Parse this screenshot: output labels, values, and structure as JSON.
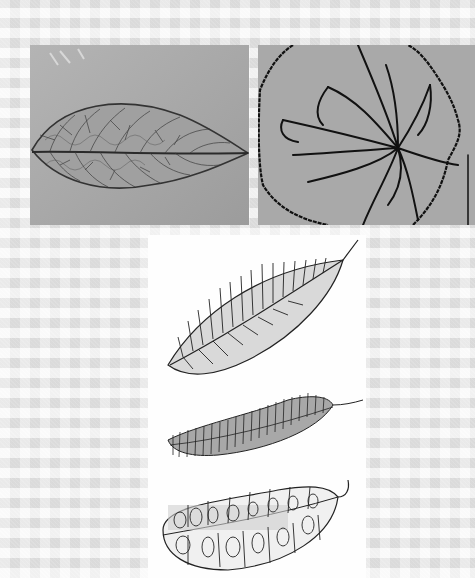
{
  "composition": {
    "background": {
      "pattern": "gingham",
      "base_color": "#e9e9e9"
    },
    "photos": [
      {
        "id": "skeleton-leaf-photo",
        "subject": "leaf skeleton with fine vein network",
        "tone": "grayscale",
        "bg_color": "#a6a6a6"
      },
      {
        "id": "vein-tracing-photo",
        "subject": "round leaf outline with traced palmate veins",
        "tone": "grayscale",
        "bg_color": "#a9a9a9"
      }
    ],
    "drawings": {
      "panel_color": "#fefefe",
      "items": [
        {
          "id": "leaf-drawing-1",
          "style": "pinnate veins with hatching"
        },
        {
          "id": "leaf-drawing-2",
          "style": "fuzzy shaded leaf with dense ticks"
        },
        {
          "id": "leaf-drawing-3",
          "style": "leaf with looping cell-like veins"
        }
      ]
    }
  }
}
